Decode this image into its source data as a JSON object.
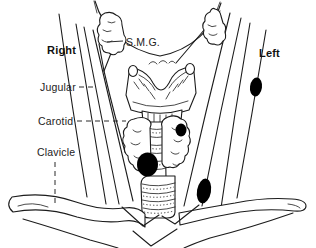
{
  "figure": {
    "type": "anatomical-line-diagram",
    "colors": {
      "background": "#ffffff",
      "ink": "#1c1c1c",
      "nodule": "#000000",
      "label_text": "#222222"
    },
    "labels": {
      "right": "Right",
      "left": "Left",
      "smg": "S.M.G.",
      "jugular": "Jugular",
      "carotid": "Carotid",
      "clavicle": "Clavicle"
    },
    "nodule_count": "4"
  }
}
